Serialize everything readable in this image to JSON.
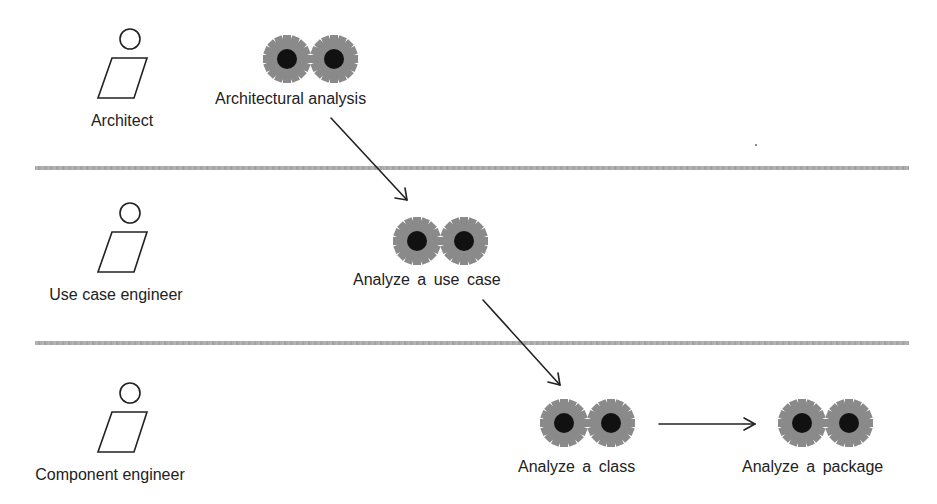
{
  "diagram": {
    "type": "activity-swimlane",
    "colors": {
      "gear_fill": "#8a8a8a",
      "gear_hub": "#111111",
      "lane_divider": "#a8a8a8",
      "stroke": "#222222",
      "background": "#ffffff"
    },
    "lanes": [
      {
        "id": "architect",
        "worker": {
          "label": "Architect",
          "icon": "worker-icon"
        },
        "activities": [
          {
            "id": "architectural-analysis",
            "label": "Architectural analysis",
            "icon": "gears-icon"
          }
        ]
      },
      {
        "id": "use-case-engineer",
        "worker": {
          "label": "Use case engineer",
          "icon": "worker-icon"
        },
        "activities": [
          {
            "id": "analyze-use-case",
            "label": "Analyze a use case",
            "icon": "gears-icon"
          }
        ]
      },
      {
        "id": "component-engineer",
        "worker": {
          "label": "Component engineer",
          "icon": "worker-icon"
        },
        "activities": [
          {
            "id": "analyze-class",
            "label": "Analyze a class",
            "icon": "gears-icon"
          },
          {
            "id": "analyze-package",
            "label": "Analyze a package",
            "icon": "gears-icon"
          }
        ]
      }
    ],
    "flows": [
      {
        "from": "architectural-analysis",
        "to": "analyze-use-case"
      },
      {
        "from": "analyze-use-case",
        "to": "analyze-class"
      },
      {
        "from": "analyze-class",
        "to": "analyze-package"
      }
    ]
  }
}
